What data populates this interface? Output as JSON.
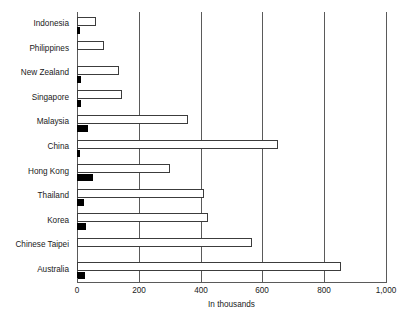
{
  "chart_data": {
    "type": "bar",
    "orientation": "horizontal",
    "title": "",
    "subtitle": "",
    "xlabel": "In thousands",
    "ylabel": "",
    "xlim": [
      0,
      1000
    ],
    "xticks": [
      0,
      200,
      400,
      600,
      800,
      1000
    ],
    "xtick_labels": [
      "0",
      "200",
      "400",
      "600",
      "800",
      "1,000"
    ],
    "grid": true,
    "grid_axis": "x",
    "legend": null,
    "legend_position": "none",
    "categories": [
      "Indonesia",
      "Philippines",
      "New Zealand",
      "Singapore",
      "Malaysia",
      "China",
      "Hong Kong",
      "Thailand",
      "Korea",
      "Chinese Taipei",
      "Australia"
    ],
    "series": [
      {
        "name": "series-open",
        "style": "outlined",
        "color": "#ffffff",
        "edge_color": "#3c3c3c",
        "values": [
          62,
          88,
          135,
          145,
          360,
          650,
          300,
          410,
          425,
          565,
          855
        ]
      },
      {
        "name": "series-filled",
        "style": "solid",
        "color": "#000000",
        "edge_color": "#000000",
        "values": [
          10,
          0,
          12,
          12,
          36,
          10,
          52,
          22,
          28,
          0,
          26
        ]
      }
    ]
  }
}
